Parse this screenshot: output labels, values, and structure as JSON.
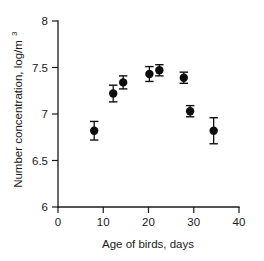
{
  "chart_data": {
    "type": "scatter",
    "title": "",
    "xlabel": "Age of birds, days",
    "ylabel": "Number concentration, log/m",
    "ylabel_superscript": "3",
    "xlim": [
      0,
      40
    ],
    "ylim": [
      6,
      8
    ],
    "xticks": [
      0,
      10,
      20,
      30,
      40
    ],
    "xtick_labels": [
      "0",
      "10",
      "20",
      "30",
      "40"
    ],
    "yticks": [
      6,
      6.5,
      7,
      7.5,
      8
    ],
    "ytick_labels": [
      "6",
      "6.5",
      "7",
      "7.5",
      "8"
    ],
    "grid": false,
    "legend": null,
    "marker_color": "#0d0d0d",
    "marker_shape": "filled-circle",
    "errorbar_style": "symmetric-capped",
    "points": [
      {
        "x": 8.0,
        "y": 6.82,
        "yerr": 0.1
      },
      {
        "x": 12.2,
        "y": 7.22,
        "yerr": 0.09
      },
      {
        "x": 14.4,
        "y": 7.34,
        "yerr": 0.07
      },
      {
        "x": 20.2,
        "y": 7.43,
        "yerr": 0.08
      },
      {
        "x": 22.4,
        "y": 7.47,
        "yerr": 0.06
      },
      {
        "x": 27.8,
        "y": 7.39,
        "yerr": 0.06
      },
      {
        "x": 29.2,
        "y": 7.03,
        "yerr": 0.06
      },
      {
        "x": 34.4,
        "y": 6.82,
        "yerr": 0.14
      }
    ]
  },
  "axes": {
    "x_title": "Age of birds, days",
    "y_title": "Number concentration, log/m",
    "y_title_exponent": "3",
    "x_tick_0": "0",
    "x_tick_1": "10",
    "x_tick_2": "20",
    "x_tick_3": "30",
    "x_tick_4": "40",
    "y_tick_0": "6",
    "y_tick_1": "6.5",
    "y_tick_2": "7",
    "y_tick_3": "7.5",
    "y_tick_4": "8"
  }
}
